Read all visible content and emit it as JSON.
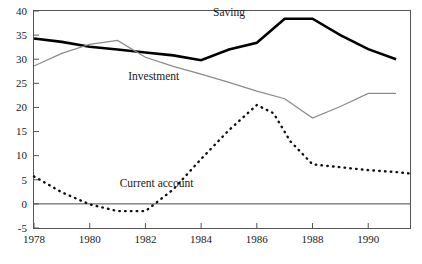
{
  "chart_data": {
    "type": "line",
    "title": "",
    "subtitle": "",
    "xlabel": "",
    "ylabel": "",
    "xlim": [
      1978,
      1991.5
    ],
    "ylim": [
      -5,
      40
    ],
    "grid": false,
    "legend_position": "inline-annotations",
    "x_ticks": [
      "1978",
      "1980",
      "1982",
      "1984",
      "1986",
      "1988",
      "1990"
    ],
    "x_tick_values": [
      1978,
      1980,
      1982,
      1984,
      1986,
      1988,
      1990
    ],
    "y_ticks": [
      "-5",
      "0",
      "5",
      "10",
      "15",
      "20",
      "25",
      "30",
      "35",
      "40"
    ],
    "y_tick_values": [
      -5,
      0,
      5,
      10,
      15,
      20,
      25,
      30,
      35,
      40
    ],
    "x": [
      1978,
      1979,
      1980,
      1981,
      1982,
      1983,
      1984,
      1985,
      1986,
      1987,
      1988,
      1989,
      1990,
      1991
    ],
    "series": [
      {
        "name": "Saving",
        "style": "solid-thick-black",
        "color": "#000000",
        "values": [
          34.3,
          33.6,
          32.6,
          32.0,
          31.4,
          30.8,
          29.8,
          32.0,
          33.4,
          38.4,
          38.4,
          35.0,
          32.1,
          30.0
        ]
      },
      {
        "name": "Investment",
        "style": "solid-thin-gray",
        "color": "#8a8a8a",
        "values": [
          28.6,
          31.2,
          33.1,
          33.9,
          30.4,
          28.5,
          26.9,
          25.2,
          23.4,
          21.8,
          17.8,
          20.2,
          22.9,
          22.9
        ]
      },
      {
        "name": "Current account",
        "style": "dotted-black",
        "color": "#111111",
        "values": [
          5.7,
          2.4,
          -0.1,
          -1.5,
          -1.5,
          -0.2,
          3.0,
          6.1,
          9.3,
          12.5,
          15.3,
          18.2,
          20.5,
          18.8
        ]
      }
    ],
    "series_extra_points": {
      "Current account": {
        "x": [
          1986.5,
          1987,
          1987.5,
          1988,
          1989,
          1990,
          1991,
          1991.5
        ],
        "values": [
          19.2,
          16.5,
          13.0,
          10.4,
          8.2,
          7.6,
          7.0,
          6.4
        ]
      }
    },
    "annotations": [
      {
        "text": "Saving",
        "x": 1985.0,
        "y": 39.0
      },
      {
        "text": "Investment",
        "x": 1982.3,
        "y": 25.6
      },
      {
        "text": "Current account",
        "x": 1982.4,
        "y": 3.4
      }
    ],
    "zero_reference_line": 0
  },
  "axis": {
    "frame_color": "#555555",
    "zero_line_color": "#4a4a4a"
  }
}
